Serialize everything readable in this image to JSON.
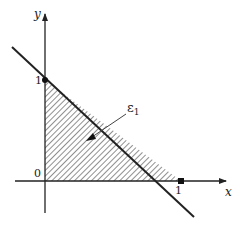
{
  "diagram": {
    "type": "region-plot",
    "axes": {
      "x_label": "x",
      "y_label": "y",
      "origin_label": "0",
      "x_tick_label": "1",
      "y_tick_label": "1"
    },
    "line": {
      "description": "x + y = 1",
      "intercepts": [
        [
          0,
          1
        ],
        [
          1,
          0
        ]
      ]
    },
    "region": {
      "label_main": "ε",
      "label_sub": "1",
      "description": "shaded triangle with vertices (0,0), (1,0), (0,1)",
      "fill": "hatched"
    },
    "colors": {
      "ink": "#222222",
      "background": "#ffffff"
    }
  }
}
